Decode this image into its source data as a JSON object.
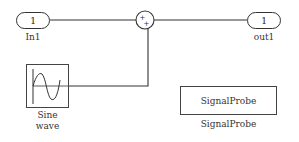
{
  "diagram": {
    "blocks": {
      "in1": {
        "value": "1",
        "label": "In1"
      },
      "sum": {
        "signs": [
          "+",
          "+"
        ]
      },
      "out1": {
        "value": "1",
        "label": "out1"
      },
      "sine": {
        "label_line1": "Sine",
        "label_line2": "wave"
      },
      "probe": {
        "text": "SignalProbe",
        "label": "SignalProbe"
      }
    },
    "colors": {
      "line": "#333333",
      "background": "#ffffff"
    }
  }
}
